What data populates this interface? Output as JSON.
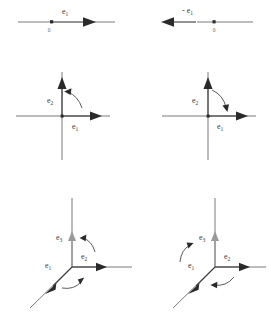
{
  "figure": {
    "background": "#ffffff",
    "line_color": "#6b6b6b",
    "vector_color": "#3d3d3d",
    "gray_vector_color": "#8e8e8e",
    "label_color": "#3a3a3a"
  },
  "panels": [
    {
      "id": "row1-left",
      "dimension": 1,
      "orientation": "positive",
      "origin_label": "0",
      "vectors": [
        {
          "name": "e1",
          "label": "e",
          "subscript": "1",
          "direction": "right"
        }
      ],
      "rotation_arrows": []
    },
    {
      "id": "row1-right",
      "dimension": 1,
      "orientation": "negative",
      "origin_label": "0",
      "vectors": [
        {
          "name": "-e1",
          "label": "- e",
          "subscript": "1",
          "direction": "left"
        }
      ],
      "rotation_arrows": []
    },
    {
      "id": "row2-left",
      "dimension": 2,
      "orientation": "positive",
      "origin_label": "",
      "vectors": [
        {
          "name": "e1",
          "label": "e",
          "subscript": "1",
          "direction": "right"
        },
        {
          "name": "e2",
          "label": "e",
          "subscript": "2",
          "direction": "up"
        }
      ],
      "rotation_arrows": [
        {
          "name": "rotation-e1-to-e2",
          "sense": "counterclockwise"
        }
      ]
    },
    {
      "id": "row2-right",
      "dimension": 2,
      "orientation": "negative",
      "origin_label": "",
      "vectors": [
        {
          "name": "e1",
          "label": "e",
          "subscript": "1",
          "direction": "right"
        },
        {
          "name": "e2",
          "label": "e",
          "subscript": "2",
          "direction": "up"
        }
      ],
      "rotation_arrows": [
        {
          "name": "rotation-e2-to-e1",
          "sense": "clockwise"
        }
      ]
    },
    {
      "id": "row3-left",
      "dimension": 3,
      "orientation": "positive",
      "origin_label": "",
      "vectors": [
        {
          "name": "e1",
          "label": "e",
          "subscript": "1",
          "direction": "down-left"
        },
        {
          "name": "e2",
          "label": "e",
          "subscript": "2",
          "direction": "right"
        },
        {
          "name": "e3",
          "label": "e",
          "subscript": "3",
          "direction": "up"
        }
      ],
      "rotation_arrows": [
        {
          "name": "rotation-e2-to-e3",
          "sense": "counterclockwise"
        },
        {
          "name": "rotation-e1-to-e2",
          "sense": "counterclockwise"
        }
      ]
    },
    {
      "id": "row3-right",
      "dimension": 3,
      "orientation": "negative",
      "origin_label": "",
      "vectors": [
        {
          "name": "e1",
          "label": "e",
          "subscript": "1",
          "direction": "down-left"
        },
        {
          "name": "e2",
          "label": "e",
          "subscript": "2",
          "direction": "right"
        },
        {
          "name": "e3",
          "label": "e",
          "subscript": "3",
          "direction": "up"
        }
      ],
      "rotation_arrows": [
        {
          "name": "rotation-e3-to-e1",
          "sense": "clockwise"
        },
        {
          "name": "rotation-e2-to-e1",
          "sense": "clockwise"
        }
      ]
    }
  ]
}
